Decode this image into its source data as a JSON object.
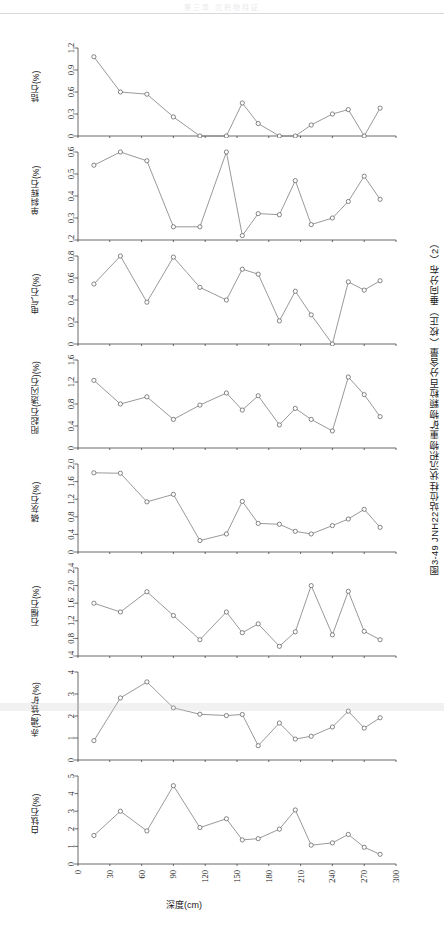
{
  "page": {
    "header_text": "第三章 沉积物特征",
    "caption": "图3-49  JNH22站位柱状沉积物重矿物颗粒百分含量（校正）垂向分布（2）"
  },
  "axis": {
    "x_label": "深度(cm)",
    "x_ticks": [
      "0",
      "30",
      "60",
      "90",
      "120",
      "150",
      "180",
      "210",
      "240",
      "270",
      "300"
    ],
    "x_min": 0,
    "x_max": 300
  },
  "chart_data": {
    "type": "line",
    "title": "图3-49  JNH22站位柱状沉积物重矿物颗粒百分含量（校正）垂向分布（2）",
    "xlabel": "深度(cm)",
    "xlim": [
      0,
      300
    ],
    "grid": false,
    "legend": "none",
    "x": [
      15,
      40,
      65,
      90,
      115,
      140,
      155,
      170,
      190,
      205,
      220,
      240,
      255,
      270,
      285,
      300
    ],
    "panels": [
      {
        "name": "zircon",
        "ylabel": "锆石(%)",
        "ylim": [
          0,
          1.2
        ],
        "yticks": [
          "0",
          "0.3",
          "0.6",
          "0.9",
          "1.2"
        ],
        "ytickvals": [
          0,
          0.3,
          0.6,
          0.9,
          1.2
        ],
        "values": [
          1.08,
          0.6,
          0.57,
          0.26,
          0.0,
          0.0,
          0.45,
          0.17,
          0.0,
          0.0,
          0.15,
          0.3,
          0.36,
          0.0,
          0.38,
          null
        ]
      },
      {
        "name": "clinopyroxene",
        "ylabel": "单斜辉石(%)",
        "ylim": [
          0.2,
          0.6
        ],
        "yticks": [
          "0.2",
          "0.3",
          "0.4",
          "0.5",
          "0.6"
        ],
        "ytickvals": [
          0.2,
          0.3,
          0.4,
          0.5,
          0.6
        ],
        "values": [
          0.54,
          0.6,
          0.56,
          0.26,
          0.26,
          0.6,
          0.22,
          0.32,
          0.315,
          0.47,
          0.27,
          0.3,
          0.375,
          0.49,
          0.385,
          null
        ]
      },
      {
        "name": "tourmaline",
        "ylabel": "电气石(%)",
        "ylim": [
          0,
          0.8
        ],
        "yticks": [
          "0",
          "0.2",
          "0.4",
          "0.6",
          "0.8"
        ],
        "ytickvals": [
          0,
          0.2,
          0.4,
          0.6,
          0.8
        ],
        "values": [
          0.545,
          0.8,
          0.38,
          0.79,
          0.515,
          0.4,
          0.68,
          0.635,
          0.21,
          0.48,
          0.265,
          0.0,
          0.565,
          0.49,
          0.575,
          null
        ]
      },
      {
        "name": "actinolite-tremolite",
        "ylabel": "阳起石(透闪石)(%)",
        "ylim": [
          0,
          1.6
        ],
        "yticks": [
          "0",
          "0.4",
          "0.8",
          "1.2",
          "1.6"
        ],
        "ytickvals": [
          0,
          0.4,
          0.8,
          1.2,
          1.6
        ],
        "values": [
          1.23,
          0.8,
          0.93,
          0.52,
          0.78,
          1.0,
          0.69,
          0.95,
          0.42,
          0.72,
          0.52,
          0.31,
          1.29,
          0.97,
          0.57,
          null
        ]
      },
      {
        "name": "apatite",
        "ylabel": "磷灰石(%)",
        "ylim": [
          0,
          2.0
        ],
        "yticks": [
          "0",
          "0.4",
          "0.8",
          "1.2",
          "1.6",
          "2.0"
        ],
        "ytickvals": [
          0,
          0.4,
          0.8,
          1.2,
          1.6,
          2.0
        ],
        "values": [
          1.8,
          1.79,
          1.14,
          1.31,
          0.26,
          0.41,
          1.15,
          0.65,
          0.63,
          0.47,
          0.41,
          0.6,
          0.75,
          0.97,
          0.56,
          null
        ]
      },
      {
        "name": "garnet",
        "ylabel": "石榴石(%)",
        "ylim": [
          0.4,
          2.4
        ],
        "yticks": [
          "0.4",
          "0.8",
          "1.2",
          "1.6",
          "2.0",
          "2.4"
        ],
        "ytickvals": [
          0.4,
          0.8,
          1.2,
          1.6,
          2.0,
          2.4
        ],
        "values": [
          1.6,
          1.4,
          1.86,
          1.32,
          0.77,
          1.4,
          0.93,
          1.13,
          0.62,
          0.95,
          2.0,
          0.88,
          1.87,
          0.96,
          0.77,
          null
        ]
      },
      {
        "name": "hematite-limonite",
        "ylabel": "赤(褐)铁矿(%)",
        "ylim": [
          0,
          4
        ],
        "yticks": [
          "0",
          "1",
          "2",
          "3",
          "4"
        ],
        "ytickvals": [
          0,
          1,
          2,
          3,
          4
        ],
        "values": [
          0.88,
          2.82,
          3.55,
          2.37,
          2.08,
          2.02,
          2.07,
          0.65,
          1.68,
          0.95,
          1.08,
          1.5,
          2.22,
          1.45,
          1.92,
          null
        ]
      },
      {
        "name": "leucoxene",
        "ylabel": "白钛石(%)",
        "ylim": [
          0,
          5
        ],
        "yticks": [
          "0",
          "1",
          "2",
          "3",
          "4",
          "5"
        ],
        "ytickvals": [
          0,
          1,
          2,
          3,
          4,
          5
        ],
        "values": [
          1.62,
          3.0,
          1.88,
          4.45,
          2.07,
          2.57,
          1.37,
          1.44,
          1.98,
          3.07,
          1.07,
          1.2,
          1.68,
          0.95,
          0.55,
          null
        ]
      }
    ]
  }
}
